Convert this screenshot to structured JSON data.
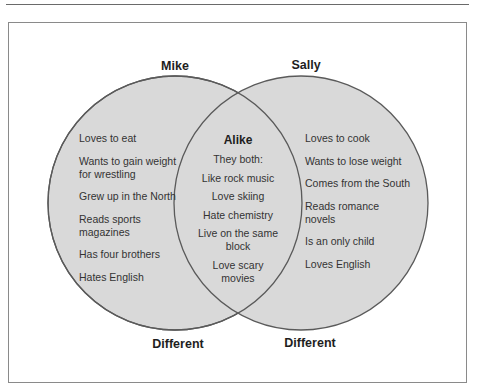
{
  "figure": {
    "caption": ""
  },
  "diagram": {
    "type": "venn",
    "colors": {
      "circle_fill": "#d9d9d9",
      "circle_stroke": "#5a5a5a",
      "frame_stroke": "#8a8a8a"
    },
    "left": {
      "name": "Mike",
      "bottom_label": "Different",
      "items": [
        "Loves to eat",
        "Wants to gain weight for wrestling",
        "Grew up in the North",
        "Reads sports magazines",
        "Has four brothers",
        "Hates English"
      ]
    },
    "center": {
      "title": "Alike",
      "intro": "They both:",
      "items": [
        "Like rock music",
        "Love skiing",
        "Hate chemistry",
        "Live on the same block",
        "Love scary movies"
      ]
    },
    "right": {
      "name": "Sally",
      "bottom_label": "Different",
      "items": [
        "Loves to cook",
        "Wants to lose weight",
        "Comes from the South",
        "Reads romance novels",
        "Is an only child",
        "Loves English"
      ]
    }
  }
}
